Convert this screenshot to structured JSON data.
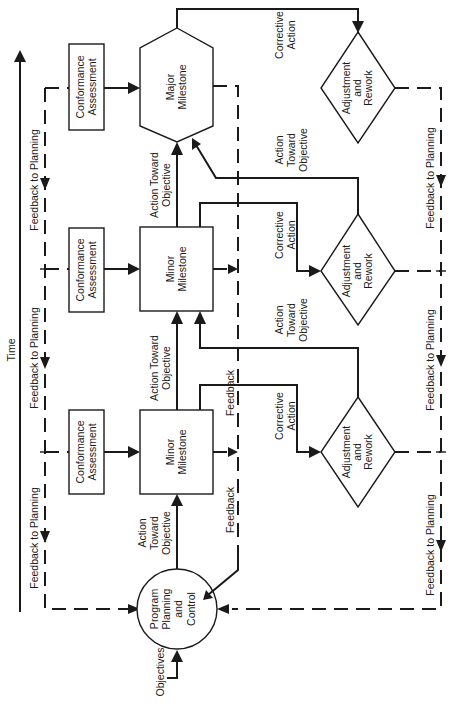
{
  "diagram": {
    "orientation": "rotated 90 degrees counter-clockwise",
    "time_axis_label": "Time",
    "nodes": {
      "program_planning": [
        "Program",
        "Planning",
        "and",
        "Control"
      ],
      "objectives_input": "Objectives",
      "minor_milestone_1": [
        "Minor",
        "Milestone"
      ],
      "minor_milestone_2": [
        "Minor",
        "Milestone"
      ],
      "major_milestone": [
        "Major",
        "Milestone"
      ],
      "conformance_1": [
        "Conformance",
        "Assessment"
      ],
      "conformance_2": [
        "Conformance",
        "Assessment"
      ],
      "conformance_3": [
        "Conformance",
        "Assessment"
      ],
      "rework_1": [
        "Adjustment",
        "and",
        "Rework"
      ],
      "rework_2": [
        "Adjustment",
        "and",
        "Rework"
      ],
      "rework_3": [
        "Adjustment",
        "and",
        "Rework"
      ]
    },
    "labels": {
      "feedback_to_planning_left_1": "Feedback to Planning",
      "feedback_to_planning_left_2": "Feedback to Planning",
      "feedback_to_planning_left_3": "Feedback to Planning",
      "feedback_to_planning_right_1": "Feedback to Planning",
      "feedback_to_planning_right_2": "Feedback to Planning",
      "feedback_to_planning_right_3": "Feedback to Planning",
      "action_toward_objective_1": [
        "Action",
        "Toward",
        "Objective"
      ],
      "action_toward_objective_2": [
        "Action Toward",
        "Objective"
      ],
      "action_toward_objective_3": [
        "Action Toward",
        "Objective"
      ],
      "action_toward_objective_r1": [
        "Action",
        "Toward",
        "Objective"
      ],
      "action_toward_objective_r2": [
        "Action",
        "Toward",
        "Objective"
      ],
      "corrective_action_1": [
        "Corrective",
        "Action"
      ],
      "corrective_action_2": [
        "Corrective",
        "Action"
      ],
      "corrective_action_3": [
        "Corrective",
        "Action"
      ],
      "feedback_1": "Feedback",
      "feedback_2": "Feedback"
    }
  }
}
